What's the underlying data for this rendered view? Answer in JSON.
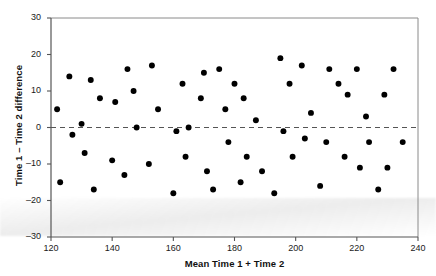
{
  "chart_data": {
    "type": "scatter",
    "title": "",
    "xlabel": "Mean Time 1 + Time 2",
    "ylabel": "Time 1 – Time 2 difference",
    "xlim": [
      120,
      240
    ],
    "ylim": [
      -30,
      30
    ],
    "xticks": [
      120,
      140,
      160,
      180,
      200,
      220,
      240
    ],
    "yticks": [
      30,
      20,
      10,
      0,
      -10,
      -20,
      -30
    ],
    "grid": false,
    "legend": null,
    "reference_line": {
      "y": 0,
      "style": "dashed",
      "color": "#555555"
    },
    "marker": {
      "shape": "circle",
      "color": "#000000",
      "size": 4
    },
    "points": [
      {
        "x": 122,
        "y": 5
      },
      {
        "x": 123,
        "y": -15
      },
      {
        "x": 126,
        "y": 14
      },
      {
        "x": 127,
        "y": -2
      },
      {
        "x": 130,
        "y": 1
      },
      {
        "x": 131,
        "y": -7
      },
      {
        "x": 133,
        "y": 13
      },
      {
        "x": 134,
        "y": -17
      },
      {
        "x": 136,
        "y": 8
      },
      {
        "x": 140,
        "y": -9
      },
      {
        "x": 141,
        "y": 7
      },
      {
        "x": 144,
        "y": -13
      },
      {
        "x": 145,
        "y": 16
      },
      {
        "x": 147,
        "y": 10
      },
      {
        "x": 148,
        "y": 0
      },
      {
        "x": 152,
        "y": -10
      },
      {
        "x": 153,
        "y": 17
      },
      {
        "x": 155,
        "y": 5
      },
      {
        "x": 160,
        "y": -18
      },
      {
        "x": 161,
        "y": -1
      },
      {
        "x": 163,
        "y": 12
      },
      {
        "x": 164,
        "y": -8
      },
      {
        "x": 165,
        "y": 0
      },
      {
        "x": 169,
        "y": 8
      },
      {
        "x": 170,
        "y": 15
      },
      {
        "x": 171,
        "y": -12
      },
      {
        "x": 173,
        "y": -17
      },
      {
        "x": 175,
        "y": 16
      },
      {
        "x": 177,
        "y": 5
      },
      {
        "x": 178,
        "y": -4
      },
      {
        "x": 180,
        "y": 12
      },
      {
        "x": 182,
        "y": -15
      },
      {
        "x": 183,
        "y": 8
      },
      {
        "x": 184,
        "y": -8
      },
      {
        "x": 187,
        "y": 2
      },
      {
        "x": 189,
        "y": -12
      },
      {
        "x": 193,
        "y": -18
      },
      {
        "x": 195,
        "y": 19
      },
      {
        "x": 196,
        "y": -1
      },
      {
        "x": 198,
        "y": 12
      },
      {
        "x": 199,
        "y": -8
      },
      {
        "x": 202,
        "y": 17
      },
      {
        "x": 203,
        "y": -3
      },
      {
        "x": 205,
        "y": 4
      },
      {
        "x": 208,
        "y": -16
      },
      {
        "x": 210,
        "y": -4
      },
      {
        "x": 211,
        "y": 16
      },
      {
        "x": 214,
        "y": 12
      },
      {
        "x": 216,
        "y": -8
      },
      {
        "x": 217,
        "y": 9
      },
      {
        "x": 220,
        "y": 16
      },
      {
        "x": 221,
        "y": -11
      },
      {
        "x": 223,
        "y": 3
      },
      {
        "x": 224,
        "y": -4
      },
      {
        "x": 227,
        "y": -17
      },
      {
        "x": 229,
        "y": 9
      },
      {
        "x": 230,
        "y": -11
      },
      {
        "x": 232,
        "y": 16
      },
      {
        "x": 235,
        "y": -4
      }
    ]
  }
}
